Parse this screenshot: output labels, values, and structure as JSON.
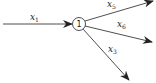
{
  "diagram": {
    "type": "flow-node",
    "node": {
      "label": "1"
    },
    "edges": [
      {
        "id": "x1",
        "var": "x",
        "sub": "1",
        "direction": "in"
      },
      {
        "id": "x5",
        "var": "x",
        "sub": "5",
        "direction": "out"
      },
      {
        "id": "x6",
        "var": "x",
        "sub": "6",
        "direction": "out"
      },
      {
        "id": "x3",
        "var": "x",
        "sub": "3",
        "direction": "out"
      }
    ]
  },
  "colors": {
    "stroke": "#222222",
    "background": "#ffffff"
  }
}
